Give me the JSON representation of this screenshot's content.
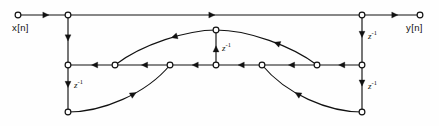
{
  "figure": {
    "type": "signal-flow-graph",
    "width": 439,
    "height": 126,
    "background_color": "#fefefe",
    "line_color": "#111111",
    "node_fill_color": "#ffffff"
  },
  "labels": {
    "input": "x[n]",
    "output": "y[n]",
    "delay_symbol": "z",
    "delay_exponent": "-1"
  },
  "delays": [
    {
      "id": "delay-left-upper",
      "label": "z",
      "exponent": "-1",
      "x": 74,
      "y": 82
    },
    {
      "id": "delay-left-lower",
      "label": "z",
      "exponent": "-1",
      "x": 74,
      "y": 82
    },
    {
      "id": "delay-center",
      "label": "z",
      "exponent": "-1",
      "x": 222,
      "y": 44
    },
    {
      "id": "delay-right-upper",
      "label": "z",
      "exponent": "-1",
      "x": 368,
      "y": 36
    },
    {
      "id": "delay-right-lower",
      "label": "z",
      "exponent": "-1",
      "x": 368,
      "y": 86
    }
  ],
  "graph_data": {
    "rows": {
      "top_y": 15,
      "middle_y": 65,
      "bottom_y": 112,
      "center_top_y": 30
    },
    "nodes": [
      {
        "id": "in",
        "x": 18,
        "y": 15,
        "name": "input-node"
      },
      {
        "id": "t1",
        "x": 68,
        "y": 15,
        "name": "top-node-left"
      },
      {
        "id": "t2",
        "x": 362,
        "y": 15,
        "name": "top-node-right"
      },
      {
        "id": "out",
        "x": 420,
        "y": 15,
        "name": "output-node"
      },
      {
        "id": "c0",
        "x": 216,
        "y": 30,
        "name": "center-top-node"
      },
      {
        "id": "m1",
        "x": 68,
        "y": 65,
        "name": "middle-node-1"
      },
      {
        "id": "m2",
        "x": 115,
        "y": 65,
        "name": "middle-node-2"
      },
      {
        "id": "m3",
        "x": 170,
        "y": 65,
        "name": "middle-node-3"
      },
      {
        "id": "m4",
        "x": 216,
        "y": 65,
        "name": "middle-node-4"
      },
      {
        "id": "m5",
        "x": 262,
        "y": 65,
        "name": "middle-node-5"
      },
      {
        "id": "m6",
        "x": 317,
        "y": 65,
        "name": "middle-node-6"
      },
      {
        "id": "m7",
        "x": 362,
        "y": 65,
        "name": "middle-node-7"
      },
      {
        "id": "b1",
        "x": 68,
        "y": 112,
        "name": "bottom-node-left"
      },
      {
        "id": "b2",
        "x": 362,
        "y": 112,
        "name": "bottom-node-right"
      }
    ],
    "straight_edges": [
      {
        "from": "in",
        "to": "t1",
        "direction": "right",
        "arrow_at": 0.62
      },
      {
        "from": "t1",
        "to": "t2",
        "direction": "right",
        "arrow_at": 0.5
      },
      {
        "from": "t2",
        "to": "out",
        "direction": "right",
        "arrow_at": 0.62
      },
      {
        "from": "t1",
        "to": "m1",
        "direction": "down",
        "arrow_at": 0.52
      },
      {
        "from": "m1",
        "to": "b1",
        "direction": "down",
        "arrow_at": 0.48
      },
      {
        "from": "t2",
        "to": "m7",
        "direction": "down",
        "arrow_at": 0.45
      },
      {
        "from": "m7",
        "to": "b2",
        "direction": "down",
        "arrow_at": 0.45
      },
      {
        "from": "m4",
        "to": "c0",
        "direction": "up",
        "arrow_at": 0.55
      },
      {
        "from": "m2",
        "to": "m1",
        "direction": "left",
        "arrow_at": 0.5
      },
      {
        "from": "m3",
        "to": "m2",
        "direction": "left",
        "arrow_at": 0.52
      },
      {
        "from": "m4",
        "to": "m3",
        "direction": "left",
        "arrow_at": 0.52
      },
      {
        "from": "m5",
        "to": "m4",
        "direction": "left",
        "arrow_at": 0.52
      },
      {
        "from": "m6",
        "to": "m5",
        "direction": "left",
        "arrow_at": 0.52
      },
      {
        "from": "m7",
        "to": "m6",
        "direction": "left",
        "arrow_at": 0.52
      }
    ],
    "curved_edges": [
      {
        "id": "curve-upper-left",
        "from": "c0",
        "to": "m2",
        "path": "M216,30 C188,30 142,44 115,65",
        "arrow_at": 0.42,
        "name": "feedback-curve-upper-left"
      },
      {
        "id": "curve-upper-right",
        "from": "m6",
        "to": "c0",
        "path": "M317,65 C292,46 248,30 216,30",
        "arrow_at": 0.45,
        "name": "feedback-curve-upper-right"
      },
      {
        "id": "curve-lower-left",
        "from": "b1",
        "to": "m3",
        "path": "M68,112 C102,112 146,94 170,65",
        "arrow_at": 0.62,
        "name": "feedback-curve-lower-left"
      },
      {
        "id": "curve-lower-right",
        "from": "b2",
        "to": "m5",
        "path": "M362,112 C328,112 286,94 262,65",
        "arrow_at": 0.62,
        "name": "feedback-curve-lower-right"
      }
    ]
  }
}
